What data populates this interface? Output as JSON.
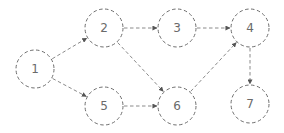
{
  "diagram": {
    "type": "directed-graph",
    "style": {
      "stroke_color": "#6e6e6e",
      "edge_color": "#8a8a8a",
      "label_color": "#6a6a6a",
      "background": "#ffffff",
      "dashed": true
    },
    "nodes": [
      {
        "id": "1",
        "label": "1",
        "x": 35,
        "y": 69,
        "r": 19
      },
      {
        "id": "2",
        "label": "2",
        "x": 104,
        "y": 28,
        "r": 19
      },
      {
        "id": "3",
        "label": "3",
        "x": 177,
        "y": 28,
        "r": 19
      },
      {
        "id": "4",
        "label": "4",
        "x": 250,
        "y": 28,
        "r": 19
      },
      {
        "id": "5",
        "label": "5",
        "x": 104,
        "y": 106,
        "r": 19
      },
      {
        "id": "6",
        "label": "6",
        "x": 177,
        "y": 106,
        "r": 19
      },
      {
        "id": "7",
        "label": "7",
        "x": 250,
        "y": 104,
        "r": 19
      }
    ],
    "edges": [
      {
        "from": "1",
        "to": "2"
      },
      {
        "from": "1",
        "to": "5"
      },
      {
        "from": "2",
        "to": "3"
      },
      {
        "from": "2",
        "to": "6"
      },
      {
        "from": "3",
        "to": "4"
      },
      {
        "from": "5",
        "to": "6"
      },
      {
        "from": "6",
        "to": "4"
      },
      {
        "from": "4",
        "to": "7"
      }
    ]
  }
}
